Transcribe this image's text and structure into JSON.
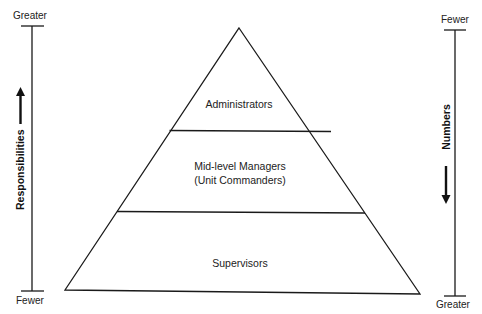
{
  "diagram": {
    "type": "pyramid",
    "tiers": [
      {
        "label": "Administrators"
      },
      {
        "label_line1": "Mid-level Managers",
        "label_line2": "(Unit Commanders)"
      },
      {
        "label": "Supervisors"
      }
    ]
  },
  "left_axis": {
    "title": "Responsibilities",
    "top_label": "Greater",
    "bottom_label": "Fewer",
    "arrow_direction": "up"
  },
  "right_axis": {
    "title": "Numbers",
    "top_label": "Fewer",
    "bottom_label": "Greater",
    "arrow_direction": "down"
  },
  "colors": {
    "stroke": "#1a1a1a",
    "background": "#ffffff"
  }
}
